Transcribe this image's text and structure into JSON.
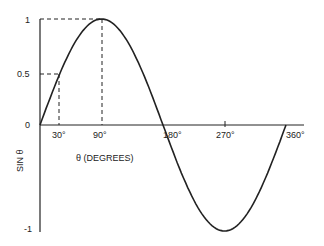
{
  "chart_data": {
    "type": "line",
    "title": "",
    "xlabel": "θ (DEGREES)",
    "ylabel": "SIN θ",
    "x_ticks": [
      "30°",
      "90°",
      "180°",
      "270°",
      "360°"
    ],
    "y_ticks": [
      "1",
      "0.5",
      "0",
      "-1"
    ],
    "xlim": [
      0,
      360
    ],
    "ylim": [
      -1,
      1
    ],
    "grid": false,
    "series": [
      {
        "name": "sin θ",
        "x": [
          0,
          30,
          90,
          180,
          270,
          360
        ],
        "y": [
          0,
          0.5,
          1,
          0,
          -1,
          0
        ]
      }
    ],
    "annotations": [
      {
        "type": "dashed-guide",
        "x": 30,
        "y": 0.5
      },
      {
        "type": "dashed-guide",
        "x": 90,
        "y": 1
      }
    ]
  },
  "labels": {
    "y_one": "1",
    "y_half": "0.5",
    "y_zero": "0",
    "y_neg_one": "-1",
    "x_30": "30°",
    "x_90": "90°",
    "x_180": "180°",
    "x_270": "270°",
    "x_360": "360°",
    "xlabel": "θ (DEGREES)",
    "ylabel": "SIN θ"
  }
}
